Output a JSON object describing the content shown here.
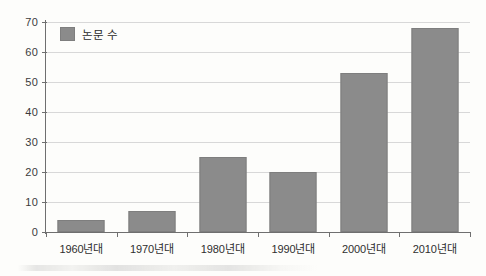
{
  "chart_data": {
    "type": "bar",
    "title": "",
    "xlabel": "",
    "ylabel": "",
    "categories": [
      "1960년대",
      "1970년대",
      "1980년대",
      "1990년대",
      "2000년대",
      "2010년대"
    ],
    "values": [
      4,
      7,
      25,
      20,
      53,
      68
    ],
    "series": [
      {
        "name": "논문 수",
        "values": [
          4,
          7,
          25,
          20,
          53,
          68
        ]
      }
    ],
    "ylim": [
      0,
      70
    ],
    "ytick_interval": 10,
    "yticks": [
      "70",
      "60",
      "50",
      "40",
      "30",
      "20",
      "10",
      "0"
    ],
    "ytick_values": [
      70,
      60,
      50,
      40,
      30,
      20,
      10,
      0
    ],
    "grid": true,
    "legend": {
      "position": "top-left-inside",
      "entries": [
        {
          "label": "논문 수",
          "color": "#8b8b8b",
          "marker": "square"
        }
      ]
    },
    "colors": {
      "bar_fill": "#8b8b8b",
      "bar_stroke": "#7e7e7e",
      "gridline": "#d8d8d8",
      "axis": "#6f6f6f",
      "text": "#2f2f2f",
      "background": "#fdfdfb"
    }
  }
}
